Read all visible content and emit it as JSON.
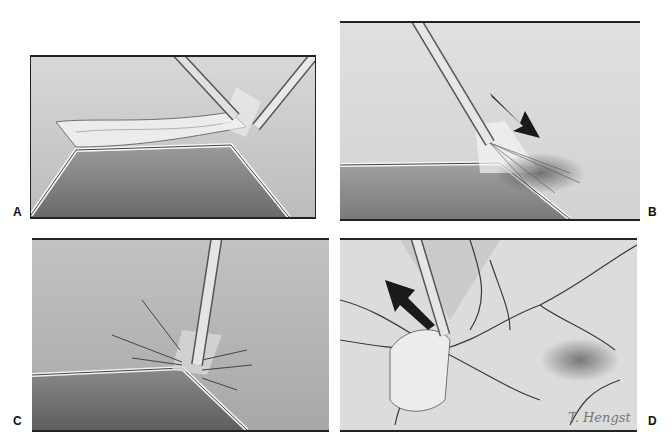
{
  "figure": {
    "panels": [
      {
        "id": "A",
        "label": "A",
        "description": "Two endoscopic instruments grasping and dissecting a membranous band of tissue stretched over a ridge"
      },
      {
        "id": "B",
        "label": "B",
        "description": "Instrument tip applying spray/irrigation toward tissue at the ridge, with dark arrow indicating direction"
      },
      {
        "id": "C",
        "label": "C",
        "description": "Instrument pressed at the ridge apex with radiating lines indicating energy application"
      },
      {
        "id": "D",
        "label": "D",
        "description": "Instrument lifting a tissue flap away from a vascularized surface, with arrow indicating retraction direction"
      }
    ],
    "signature": "T. Hengst",
    "colors": {
      "background": "#ffffff",
      "border": "#222222",
      "tissue_light": "#e6e6e6",
      "tissue_mid": "#bdbdbd",
      "tissue_dark": "#6e6e6e",
      "arrow": "#1a1a1a"
    }
  }
}
